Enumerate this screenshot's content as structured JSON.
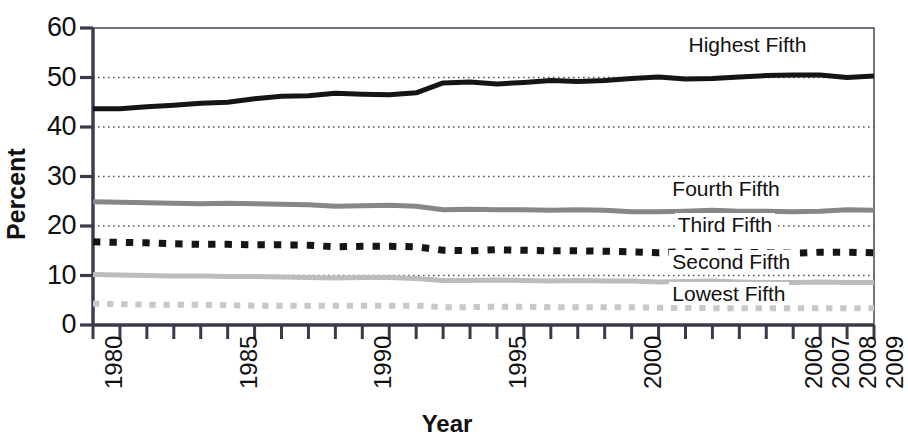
{
  "chart_data": {
    "type": "line",
    "title": "",
    "xlabel": "Year",
    "ylabel": "Percent",
    "ylim": [
      0,
      60
    ],
    "yticks": [
      0,
      10,
      20,
      30,
      40,
      50,
      60
    ],
    "ytick_labels": [
      "0",
      "10",
      "20",
      "30",
      "40",
      "50",
      "60"
    ],
    "grid": true,
    "grid_style": "dotted-horizontal",
    "legend_position": "inline-right-of-series",
    "x": [
      1980,
      1981,
      1982,
      1983,
      1984,
      1985,
      1986,
      1987,
      1988,
      1989,
      1990,
      1991,
      1992,
      1993,
      1994,
      1995,
      1996,
      1997,
      1998,
      1999,
      2000,
      2001,
      2002,
      2003,
      2004,
      2005,
      2006,
      2007,
      2008,
      2009
    ],
    "xtick_labels_shown": [
      "1980",
      "1985",
      "1990",
      "1995",
      "2000",
      "2006",
      "2007",
      "2008",
      "2009"
    ],
    "xtick_label_values": [
      1980,
      1985,
      1990,
      1995,
      2000,
      2006,
      2007,
      2008,
      2009
    ],
    "series": [
      {
        "name": "Highest Fifth",
        "color": "#151515",
        "style": "solid",
        "width": 5,
        "label_x": 2002.0,
        "label_y": 56.5,
        "values": [
          43.7,
          43.7,
          44.1,
          44.4,
          44.8,
          45.0,
          45.7,
          46.2,
          46.3,
          46.8,
          46.6,
          46.5,
          46.9,
          48.9,
          49.1,
          48.7,
          49.0,
          49.4,
          49.2,
          49.4,
          49.8,
          50.1,
          49.7,
          49.8,
          50.1,
          50.4,
          50.5,
          50.5,
          50.0,
          50.3
        ]
      },
      {
        "name": "Fourth Fifth",
        "color": "#878787",
        "style": "solid",
        "width": 5,
        "label_x": 2001.4,
        "label_y": 27.5,
        "values": [
          24.9,
          24.8,
          24.7,
          24.6,
          24.5,
          24.6,
          24.5,
          24.4,
          24.3,
          24.0,
          24.1,
          24.2,
          24.0,
          23.3,
          23.4,
          23.3,
          23.3,
          23.2,
          23.3,
          23.2,
          22.9,
          22.9,
          23.0,
          23.2,
          23.0,
          23.0,
          22.9,
          23.0,
          23.3,
          23.2
        ]
      },
      {
        "name": "Third Fifth",
        "color": "#151515",
        "style": "dashed",
        "width": 7,
        "label_x": 2001.6,
        "label_y": 20.2,
        "values": [
          16.8,
          16.7,
          16.6,
          16.4,
          16.3,
          16.3,
          16.2,
          16.2,
          16.1,
          15.8,
          15.9,
          15.9,
          15.8,
          15.1,
          15.0,
          15.2,
          15.1,
          15.0,
          15.0,
          14.9,
          14.8,
          14.6,
          14.8,
          14.8,
          14.7,
          14.6,
          14.5,
          14.7,
          14.7,
          14.6
        ]
      },
      {
        "name": "Second Fifth",
        "color": "#bcbcbc",
        "style": "solid",
        "width": 5,
        "label_x": 2001.4,
        "label_y": 12.8,
        "values": [
          10.2,
          10.1,
          10.0,
          9.9,
          9.9,
          9.8,
          9.8,
          9.7,
          9.6,
          9.5,
          9.6,
          9.6,
          9.4,
          9.0,
          9.0,
          9.1,
          9.0,
          8.9,
          9.0,
          8.9,
          8.9,
          8.7,
          8.8,
          8.9,
          8.7,
          8.6,
          8.6,
          8.7,
          8.6,
          8.6
        ]
      },
      {
        "name": "Lowest Fifth",
        "color": "#c8c8c8",
        "style": "dashed",
        "width": 6,
        "label_x": 2001.4,
        "label_y": 6.2,
        "values": [
          4.3,
          4.2,
          4.1,
          4.1,
          4.1,
          4.0,
          3.9,
          3.9,
          3.9,
          3.9,
          3.9,
          3.9,
          3.9,
          3.6,
          3.6,
          3.7,
          3.7,
          3.6,
          3.6,
          3.6,
          3.6,
          3.5,
          3.5,
          3.4,
          3.4,
          3.4,
          3.4,
          3.4,
          3.4,
          3.4
        ]
      }
    ]
  },
  "axis_titles": {
    "y": "Percent",
    "x": "Year"
  }
}
